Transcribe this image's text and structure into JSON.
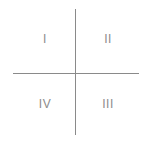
{
  "diagram": {
    "type": "quadrant",
    "quadrants": {
      "top_left": "I",
      "top_right": "II",
      "bottom_right": "III",
      "bottom_left": "IV"
    },
    "colors": {
      "axis": "#8a8a8a",
      "label": "#8c8c8c",
      "background": "#ffffff"
    }
  }
}
